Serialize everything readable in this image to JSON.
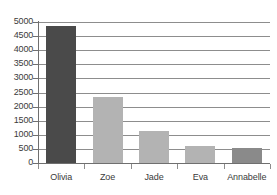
{
  "chart_data": {
    "type": "bar",
    "title": "",
    "xlabel": "",
    "ylabel": "",
    "categories": [
      "Olivia",
      "Zoe",
      "Jade",
      "Eva",
      "Annabelle"
    ],
    "values": [
      4850,
      2350,
      1150,
      620,
      520
    ],
    "bar_colors": [
      "#4a4a4a",
      "#b3b3b3",
      "#b3b3b3",
      "#b3b3b3",
      "#8a8a8a"
    ],
    "ylim": [
      0,
      5000
    ],
    "ytick_labels": [
      "0",
      "500",
      "1000",
      "1500",
      "2000",
      "2500",
      "3000",
      "3500",
      "4000",
      "4500",
      "5000"
    ],
    "ytick_values": [
      0,
      500,
      1000,
      1500,
      2000,
      2500,
      3000,
      3500,
      4000,
      4500,
      5000
    ],
    "grid": true,
    "grid_axis": "y",
    "legend": false,
    "legend_position": "none",
    "axis_color": "#6f6f6f",
    "grid_color": "#8d8d8d",
    "text_color": "#3b3b3b",
    "background": "#ffffff"
  }
}
